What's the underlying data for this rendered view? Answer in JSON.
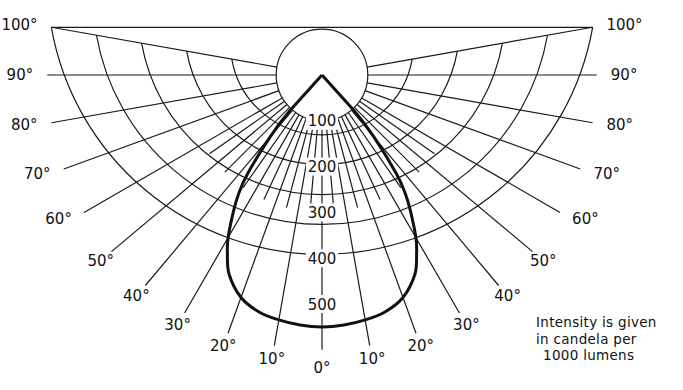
{
  "chart_data": {
    "type": "polar",
    "title": "",
    "center_px": [
      322,
      75
    ],
    "px_per_unit": 0.458,
    "radial_axis": {
      "ticks": [
        100,
        200,
        300,
        400,
        500,
        600
      ],
      "labels": [
        "100",
        "200",
        "300",
        "400",
        "500"
      ],
      "range": [
        0,
        600
      ]
    },
    "angular_axis": {
      "ticks_deg": [
        0,
        10,
        20,
        30,
        40,
        50,
        60,
        70,
        80,
        90,
        100
      ],
      "labels": [
        "0°",
        "10°",
        "20°",
        "30°",
        "40°",
        "50°",
        "60°",
        "70°",
        "80°",
        "90°",
        "100°"
      ],
      "range_deg": [
        -100,
        100
      ],
      "minor_step_deg": 5
    },
    "series": [
      {
        "name": "Intensity distribution",
        "angles_deg": [
          0,
          5,
          10,
          15,
          20,
          25,
          28,
          30,
          33,
          35,
          37,
          40,
          42,
          45
        ],
        "values": [
          550,
          548,
          543,
          535,
          517,
          480,
          440,
          410,
          355,
          318,
          270,
          175,
          105,
          0
        ]
      }
    ],
    "note": [
      "Intensity is given",
      "in candela per",
      "1000 lumens"
    ],
    "grid": true,
    "legend": "none"
  }
}
